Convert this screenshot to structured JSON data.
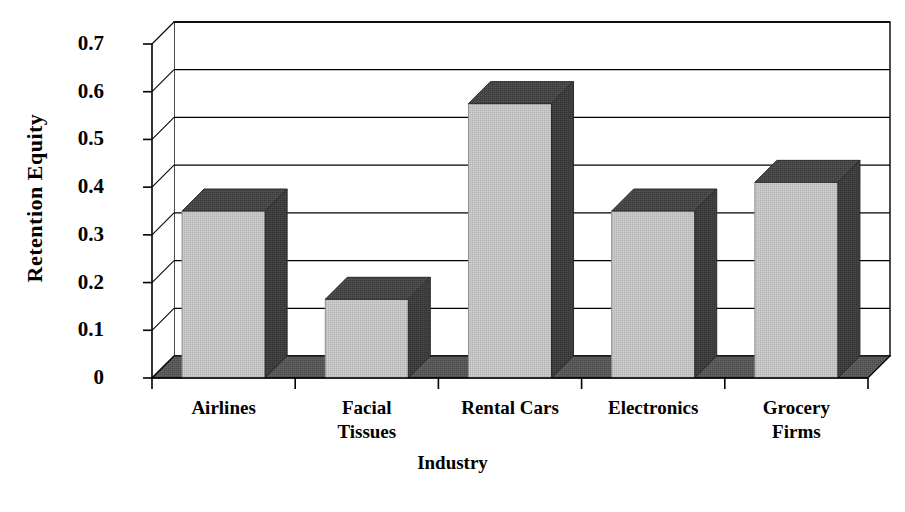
{
  "chart_data": {
    "type": "bar",
    "title": "",
    "subtitle": "",
    "xlabel": "Industry",
    "ylabel": "Retention Equity",
    "categories": [
      "Airlines",
      "Facial Tissues",
      "Rental Cars",
      "Electronics",
      "Grocery Firms"
    ],
    "category_label_lines": [
      [
        "Airlines"
      ],
      [
        "Facial",
        "Tissues"
      ],
      [
        "Rental Cars"
      ],
      [
        "Electronics"
      ],
      [
        "Grocery",
        "Firms"
      ]
    ],
    "values": [
      0.35,
      0.165,
      0.575,
      0.35,
      0.41
    ],
    "ylim": [
      0,
      0.7
    ],
    "ytick_values": [
      0,
      0.1,
      0.2,
      0.3,
      0.4,
      0.5,
      0.6,
      0.7
    ],
    "ytick_labels": [
      "0",
      "0.1",
      "0.2",
      "0.3",
      "0.4",
      "0.5",
      "0.6",
      "0.7"
    ],
    "grid": true,
    "grid_axis": "y",
    "legend": false,
    "legend_position": "none",
    "style": "3d-column",
    "colors": {
      "bar_front": "#c0c0c0",
      "bar_top": "#4a4a4a",
      "bar_side": "#3c3c3c",
      "floor": "#555555",
      "axis": "#000000",
      "grid": "#000000",
      "background": "#ffffff",
      "text": "#000000"
    }
  },
  "axes": {
    "y_title": "Retention Equity",
    "x_title": "Industry"
  }
}
